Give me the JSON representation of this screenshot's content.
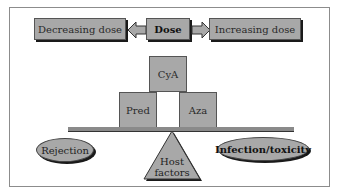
{
  "diagram": {
    "top_row": {
      "left_box": "Decreasing dose",
      "center_box": "Dose",
      "right_box": "Increasing dose"
    },
    "drugs": {
      "top": "CyA",
      "left": "Pred",
      "right": "Aza"
    },
    "outcomes": {
      "left": "Rejection",
      "right": "Infection/toxicity"
    },
    "fulcrum": {
      "line1": "Host",
      "line2": "factors"
    },
    "colors": {
      "fill": "#a8a8a8",
      "shadow": "#1a1a1a",
      "background": "#ffffff"
    }
  }
}
